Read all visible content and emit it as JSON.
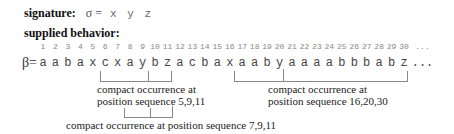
{
  "signature": {
    "label": "signature:",
    "formula": "σ =",
    "alphabet": [
      "x",
      "y",
      "z"
    ],
    "alphabet_text": "x y z"
  },
  "behavior": {
    "label": "supplied behavior:",
    "symbol": "β=",
    "positions": [
      "1",
      "2",
      "3",
      "4",
      "5",
      "6",
      "7",
      "8",
      "9",
      "10",
      "11",
      "12",
      "13",
      "14",
      "15",
      "16",
      "17",
      "18",
      "19",
      "20",
      "21",
      "22",
      "23",
      "24",
      "25",
      "26",
      "27",
      "28",
      "29",
      "30",
      "..."
    ],
    "sequence": [
      "a",
      "a",
      "b",
      "a",
      "x",
      "c",
      "x",
      "a",
      "y",
      "b",
      "z",
      "a",
      "c",
      "b",
      "a",
      "x",
      "a",
      "a",
      "b",
      "y",
      "a",
      "a",
      "a",
      "a",
      "b",
      "b",
      "b",
      "a",
      "b",
      "z",
      "..."
    ]
  },
  "occurrences": [
    {
      "positions": [
        5,
        9,
        11
      ],
      "label_line1": "compact occurrence at",
      "label_line2": "position sequence 5,9,11"
    },
    {
      "positions": [
        7,
        9,
        11
      ],
      "label": "compact occurrence at position sequence 7,9,11"
    },
    {
      "positions": [
        16,
        20,
        30
      ],
      "label_line1": "compact occurrence at",
      "label_line2": "position sequence 16,20,30"
    }
  ]
}
